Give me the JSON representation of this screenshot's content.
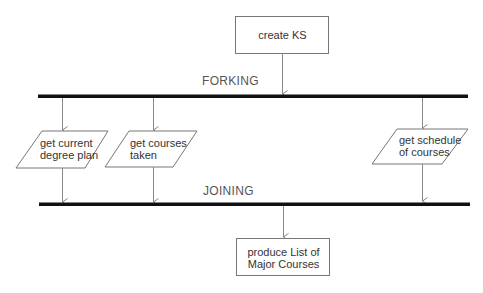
{
  "diagram": {
    "type": "activity-fork-join",
    "start_node": {
      "label": "create KS"
    },
    "fork_bar": {
      "label": "FORKING"
    },
    "join_bar": {
      "label": "JOINING"
    },
    "parallel_activities": [
      {
        "line1": "get current",
        "line2": "degree plan"
      },
      {
        "line1": "get courses",
        "line2": "taken"
      },
      {
        "line1": "get schedule",
        "line2": "of courses"
      }
    ],
    "end_node": {
      "line1": "produce List of",
      "line2": "Major Courses"
    }
  },
  "colors": {
    "bar": "#111111",
    "edge": "#777777",
    "text": "#333333"
  }
}
